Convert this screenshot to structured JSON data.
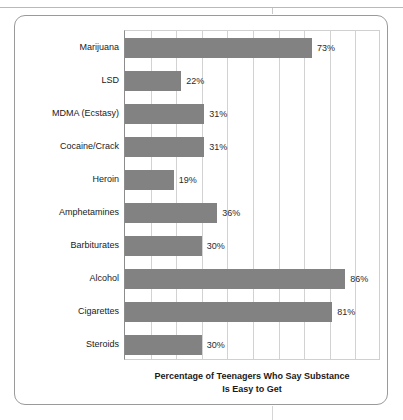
{
  "chart_data": {
    "type": "bar",
    "orientation": "horizontal",
    "title": "",
    "xlabel": "Percentage of Teenagers Who Say Substance Is Easy to Get",
    "xlabel_line1": "Percentage of Teenagers Who Say Substance",
    "xlabel_line2": "Is Easy to Get",
    "ylabel": "Substance",
    "categories": [
      "Marijuana",
      "LSD",
      "MDMA (Ecstasy)",
      "Cocaine/Crack",
      "Heroin",
      "Amphetamines",
      "Barbiturates",
      "Alcohol",
      "Cigarettes",
      "Steroids"
    ],
    "values": [
      73,
      22,
      31,
      31,
      19,
      36,
      30,
      86,
      81,
      30
    ],
    "value_labels": [
      "73%",
      "22%",
      "31%",
      "31%",
      "19%",
      "36%",
      "30%",
      "86%",
      "81%",
      "30%"
    ],
    "xlim": [
      0,
      100
    ],
    "gridline_interval": 10,
    "grid": true,
    "legend": "none",
    "bar_color": "#828282",
    "grid_color": "#d2d2d2",
    "axis_color": "#8c8c8c",
    "text_color": "#1a1a1a"
  }
}
